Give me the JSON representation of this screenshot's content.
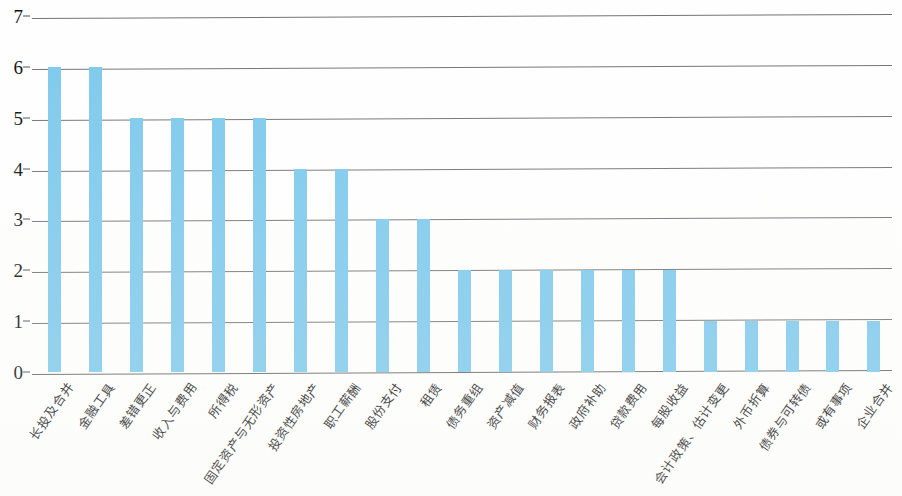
{
  "chart_data": {
    "type": "bar",
    "title": "",
    "subtitle": "",
    "xlabel": "",
    "ylabel": "",
    "ylim": [
      0,
      7
    ],
    "yticks": [
      0,
      1,
      2,
      3,
      4,
      5,
      6,
      7
    ],
    "ytick_labels": [
      "0",
      "1",
      "2",
      "3",
      "4",
      "5",
      "6",
      "7"
    ],
    "grid": true,
    "legend": false,
    "legend_position": "none",
    "bar_color": "#7ec9ec",
    "categories": [
      "长投及合并",
      "金融工具",
      "差错更正",
      "收入与费用",
      "所得税",
      "固定资产与无形资产",
      "投资性房地产",
      "职工薪酬",
      "股份支付",
      "租赁",
      "债务重组",
      "资产减值",
      "财务报表",
      "政府补助",
      "贷款费用",
      "每股收益",
      "会计政策、估计变更",
      "外币折算",
      "债券与可转债",
      "或有事项",
      "企业合并"
    ],
    "values": [
      6,
      6,
      5,
      5,
      5,
      5,
      4,
      4,
      3,
      3,
      2,
      2,
      2,
      2,
      2,
      2,
      1,
      1,
      1,
      1,
      1
    ]
  },
  "colors": {
    "bar": "#7ec9ec",
    "gridline": "#5a5a5a",
    "axis_text": "#101010",
    "background": "#fefefe"
  }
}
